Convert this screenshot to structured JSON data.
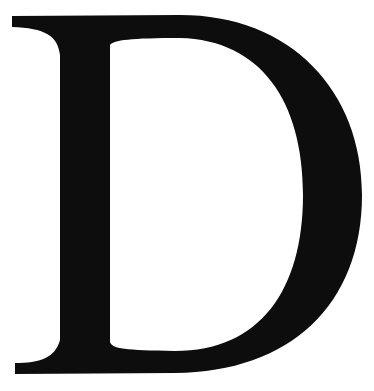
{
  "glyph": {
    "character": "D",
    "style": "serif capital letter",
    "color": "#0d0d0d",
    "background": "#ffffff"
  }
}
